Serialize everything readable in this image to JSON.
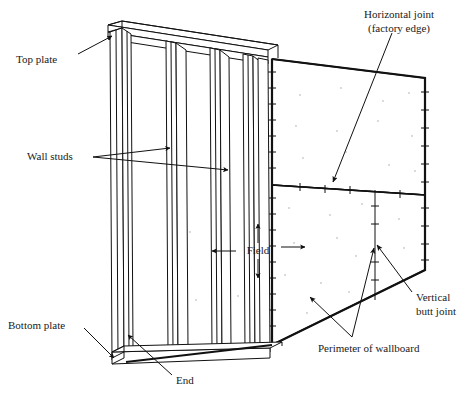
{
  "figure": {
    "background_color": "#ffffff",
    "line_color": "#111111",
    "width": 469,
    "height": 401
  },
  "labels": {
    "top_plate": "Top plate",
    "wall_studs": "Wall studs",
    "bottom_plate": "Bottom plate",
    "end": "End",
    "field": "Field",
    "horizontal_joint_line1": "Horizontal joint",
    "horizontal_joint_line2": "(factory edge)",
    "vertical_butt_joint_line1": "Vertical",
    "vertical_butt_joint_line2": "butt joint",
    "perimeter_of_wallboard": "Perimeter of wallboard"
  },
  "callouts": [
    {
      "name": "top-plate",
      "text": "Top plate",
      "text_x": 16,
      "text_y": 60,
      "anchor": "start",
      "arrows": [
        {
          "from_x": 78,
          "from_y": 54,
          "to_x": 112,
          "to_y": 36
        }
      ]
    },
    {
      "name": "wall-studs",
      "text": "Wall studs",
      "text_x": 27,
      "text_y": 157,
      "anchor": "start",
      "arrows": [
        {
          "from_x": 93,
          "from_y": 157,
          "to_x": 170,
          "to_y": 148
        },
        {
          "from_x": 93,
          "from_y": 157,
          "to_x": 228,
          "to_y": 170
        }
      ]
    },
    {
      "name": "bottom-plate",
      "text": "Bottom plate",
      "text_x": 8,
      "text_y": 326,
      "anchor": "start",
      "arrows": [
        {
          "from_x": 84,
          "from_y": 328,
          "to_x": 114,
          "to_y": 358
        }
      ]
    },
    {
      "name": "end",
      "text": "End",
      "text_x": 176,
      "text_y": 381,
      "anchor": "start",
      "arrows": [
        {
          "from_x": 172,
          "from_y": 375,
          "to_x": 128,
          "to_y": 335
        }
      ]
    },
    {
      "name": "horizontal-joint",
      "text": "Horizontal joint",
      "text_x": 433,
      "text_y": 15,
      "anchor": "end",
      "arrows": [
        {
          "from_x": 392,
          "from_y": 33,
          "to_x": 333,
          "to_y": 182
        }
      ]
    },
    {
      "name": "vertical-butt-joint",
      "text": "Vertical",
      "text_x": 416,
      "text_y": 298,
      "anchor": "start",
      "arrows": [
        {
          "from_x": 412,
          "from_y": 292,
          "to_x": 377,
          "to_y": 245
        }
      ]
    },
    {
      "name": "perimeter-of-wallboard",
      "text": "Perimeter of wallboard",
      "text_x": 318,
      "text_y": 349,
      "anchor": "start",
      "arrows": [
        {
          "from_x": 352,
          "from_y": 337,
          "to_x": 310,
          "to_y": 297
        },
        {
          "from_x": 352,
          "from_y": 337,
          "to_x": 374,
          "to_y": 248
        }
      ]
    }
  ],
  "field_marker": {
    "name": "field",
    "label": "Field",
    "center_x": 258,
    "center_y": 251,
    "arrows": [
      {
        "dir": "up",
        "from_x": 258,
        "from_y": 243,
        "to_x": 258,
        "to_y": 224
      },
      {
        "dir": "down",
        "from_x": 258,
        "from_y": 259,
        "to_x": 258,
        "to_y": 278
      },
      {
        "dir": "left",
        "from_x": 236,
        "from_y": 251,
        "to_x": 212,
        "to_y": 251
      },
      {
        "dir": "right",
        "from_x": 281,
        "from_y": 247,
        "to_x": 305,
        "to_y": 247
      }
    ]
  },
  "geometry": {
    "wallboard_upper_panel": "272,59 425,78 425,195 272,185",
    "wallboard_lower_panel": "272,185 425,195 425,270 272,345",
    "horizontal_joint": {
      "x1": 272,
      "y1": 185,
      "x2": 425,
      "y2": 195
    },
    "vertical_butt_joint": {
      "x1": 375,
      "y1": 190,
      "x2": 375,
      "y2": 300
    },
    "board_left_edge": {
      "x1": 272,
      "y1": 59,
      "x2": 272,
      "y2": 345
    },
    "board_right_edge": {
      "x1": 425,
      "y1": 78,
      "x2": 425,
      "y2": 270
    },
    "stud_count_visible": 3
  },
  "fasteners": {
    "description": "tick marks along wallboard perimeter",
    "spacing_px": 16
  }
}
